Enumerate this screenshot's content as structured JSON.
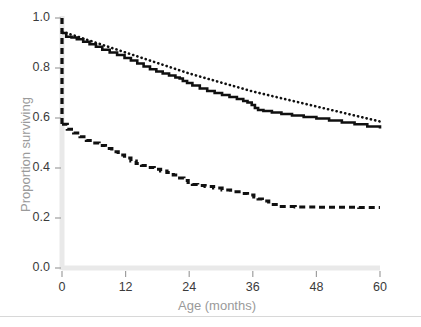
{
  "chart_data": {
    "type": "line",
    "title": "",
    "subtitle": "",
    "xlabel": "Age (months)",
    "ylabel": "Proportion surviving",
    "xlim": [
      0,
      60
    ],
    "ylim": [
      0.0,
      1.0
    ],
    "xticks": [
      0,
      12,
      24,
      36,
      48,
      60
    ],
    "xtick_labels": [
      "0",
      "12",
      "24",
      "36",
      "48",
      "60"
    ],
    "yticks": [
      0.0,
      0.2,
      0.4,
      0.6,
      0.8,
      1.0
    ],
    "ytick_labels": [
      "0.0",
      "0.2",
      "0.4",
      "0.6",
      "0.8",
      "1.0"
    ],
    "grid": false,
    "legend": "none",
    "annotations": [],
    "series": [
      {
        "name": "upper-survival-curve-solid",
        "style": "solid-step",
        "color": "#101010",
        "x": [
          0,
          0.8,
          1.8,
          2.8,
          4,
          5.2,
          6.4,
          7.6,
          9,
          10.4,
          11.8,
          13,
          14.2,
          15.4,
          16.6,
          17.8,
          19,
          20.2,
          21.4,
          22.2,
          22.8,
          23.6,
          24.6,
          26,
          27.4,
          28.8,
          30.2,
          31.6,
          33,
          34.2,
          35,
          35.8,
          36.4,
          37,
          38,
          39.6,
          41.4,
          43.4,
          45.6,
          48,
          50.4,
          52.8,
          55.2,
          57.6,
          60
        ],
        "y": [
          0.94,
          0.925,
          0.922,
          0.915,
          0.905,
          0.895,
          0.885,
          0.873,
          0.862,
          0.852,
          0.84,
          0.83,
          0.818,
          0.806,
          0.795,
          0.786,
          0.778,
          0.77,
          0.762,
          0.758,
          0.748,
          0.74,
          0.73,
          0.718,
          0.708,
          0.7,
          0.692,
          0.684,
          0.676,
          0.668,
          0.662,
          0.652,
          0.64,
          0.632,
          0.628,
          0.622,
          0.616,
          0.61,
          0.604,
          0.598,
          0.59,
          0.582,
          0.575,
          0.566,
          0.558
        ]
      },
      {
        "name": "upper-expected-curve-dotted",
        "style": "dotted",
        "color": "#101010",
        "x": [
          0,
          2,
          4,
          6,
          8,
          10,
          12,
          14,
          16,
          18,
          20,
          22,
          24,
          26,
          28,
          30,
          32,
          34,
          36,
          38,
          40,
          42,
          44,
          46,
          48,
          50,
          52,
          54,
          56,
          58,
          60
        ],
        "y": [
          0.945,
          0.932,
          0.918,
          0.904,
          0.89,
          0.876,
          0.862,
          0.848,
          0.834,
          0.82,
          0.806,
          0.792,
          0.778,
          0.766,
          0.754,
          0.742,
          0.73,
          0.718,
          0.706,
          0.696,
          0.686,
          0.676,
          0.666,
          0.656,
          0.646,
          0.636,
          0.626,
          0.616,
          0.606,
          0.596,
          0.586
        ]
      },
      {
        "name": "lower-survival-curve-dashed",
        "style": "dashed-step",
        "color": "#101010",
        "x": [
          0,
          1,
          2.2,
          3.4,
          4.6,
          5.8,
          7,
          8.2,
          9.4,
          10.6,
          11.8,
          13,
          14,
          15,
          16.2,
          17.4,
          18.6,
          19.8,
          21,
          22.2,
          23,
          23.8,
          24.6,
          25.6,
          27,
          28.6,
          30.2,
          31.8,
          33.4,
          35,
          36.2,
          37,
          37.8,
          39,
          41,
          44,
          48,
          52,
          56,
          60
        ],
        "y": [
          0.575,
          0.555,
          0.54,
          0.525,
          0.51,
          0.5,
          0.49,
          0.478,
          0.465,
          0.452,
          0.44,
          0.428,
          0.418,
          0.41,
          0.402,
          0.395,
          0.388,
          0.382,
          0.372,
          0.36,
          0.35,
          0.342,
          0.334,
          0.33,
          0.326,
          0.32,
          0.312,
          0.305,
          0.298,
          0.292,
          0.284,
          0.276,
          0.268,
          0.254,
          0.246,
          0.244,
          0.243,
          0.243,
          0.242,
          0.242
        ]
      },
      {
        "name": "vertical-dashed-drop-line",
        "style": "dashed-vertical",
        "color": "#101010",
        "x": [
          0,
          0
        ],
        "y": [
          1.0,
          0.575
        ]
      }
    ]
  },
  "axes": {
    "y_axis_color": "#e9e9e9",
    "x_axis_color": "#e9e9e9",
    "tick_color": "#b0b0b0",
    "label_color": "#9a9a9a",
    "tick_label_color": "#3b3b3b"
  },
  "footer_rule_color": "#d8d8d8"
}
